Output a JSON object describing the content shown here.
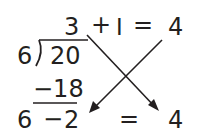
{
  "division": {
    "quotient": "3",
    "divisor": "6",
    "dividend": "20",
    "product": "−18"
  },
  "top_equation": {
    "plus": "+",
    "addend": "I",
    "equals": "=",
    "result": "4"
  },
  "bottom_equation": {
    "left": "6",
    "minus": "−",
    "right": "2",
    "equals": "=",
    "result": "4"
  },
  "colors": {
    "ink": "#231f20",
    "background": "#ffffff"
  }
}
